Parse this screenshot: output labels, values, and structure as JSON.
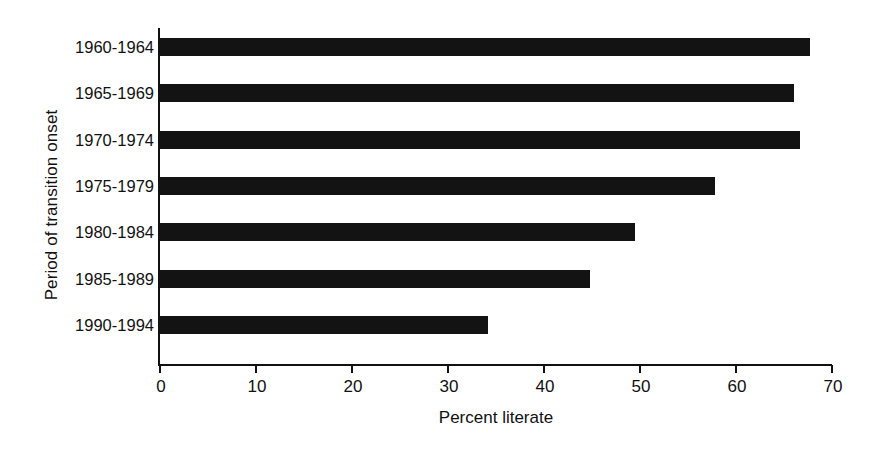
{
  "chart_data": {
    "type": "bar",
    "orientation": "horizontal",
    "title": "",
    "xlabel": "Percent literate",
    "ylabel": "Period of transition onset",
    "categories": [
      "1960-1964",
      "1965-1969",
      "1970-1974",
      "1975-1979",
      "1980-1984",
      "1985-1989",
      "1990-1994"
    ],
    "values": [
      67.7,
      66.0,
      66.7,
      57.8,
      49.5,
      44.8,
      34.2
    ],
    "xlim": [
      0,
      70
    ],
    "xticks": [
      0,
      10,
      20,
      30,
      40,
      50,
      60,
      70
    ],
    "xtick_labels": [
      "0",
      "10",
      "20",
      "30",
      "40",
      "50",
      "60",
      "70"
    ],
    "grid": false,
    "legend": false,
    "bar_color": "#131313"
  }
}
